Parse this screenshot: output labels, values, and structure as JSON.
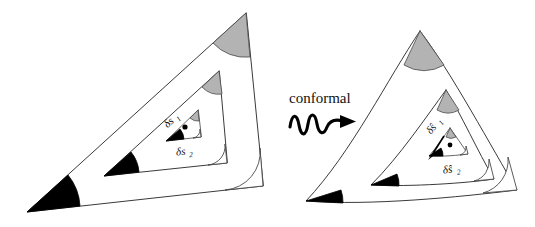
{
  "figure": {
    "background_color": "#ffffff",
    "stroke_color": "#3a3a3a",
    "caption": {
      "label": "conformal",
      "arrow_icon": "squiggly-arrow-icon"
    },
    "left_panel": {
      "name": "domain-triangle-panel",
      "description": "Straight-edged nested triangles before mapping",
      "labels": {
        "arc1": "δs",
        "arc1_sub": "1",
        "arc2": "δs",
        "arc2_sub": "2"
      },
      "angles": [
        {
          "name": "apex-angle",
          "fill": "#b3b3b3",
          "style": "gray"
        },
        {
          "name": "lower-left-angle",
          "fill": "#000000",
          "style": "black"
        },
        {
          "name": "lower-right-angle",
          "fill": "#ffffff",
          "style": "white"
        }
      ]
    },
    "right_panel": {
      "name": "image-triangle-panel",
      "description": "Curved-edged nested triangles after conformal mapping",
      "labels": {
        "arc1": "δŝ",
        "arc1_sub": "1",
        "arc2": "δŝ",
        "arc2_sub": "2"
      },
      "angles": [
        {
          "name": "apex-angle",
          "fill": "#b3b3b3",
          "style": "gray"
        },
        {
          "name": "lower-left-angle",
          "fill": "#000000",
          "style": "black"
        },
        {
          "name": "lower-right-angle",
          "fill": "#ffffff",
          "style": "white"
        }
      ]
    }
  }
}
